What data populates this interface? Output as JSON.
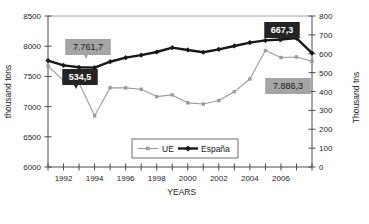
{
  "chart_data": {
    "type": "line",
    "title": "",
    "xlabel": "YEARS",
    "ylabel": "thousand tons",
    "y2label": "Thousand tns",
    "grid": false,
    "legend_position": "bottom-center",
    "x": [
      1991,
      1992,
      1993,
      1994,
      1995,
      1996,
      1997,
      1998,
      1999,
      2000,
      2001,
      2002,
      2003,
      2004,
      2005,
      2006,
      2007,
      2008
    ],
    "xticklabels": [
      "1992",
      "1994",
      "1996",
      "1998",
      "2000",
      "2002",
      "2004",
      "2006"
    ],
    "xtick_years": [
      1992,
      1994,
      1996,
      1998,
      2000,
      2002,
      2004,
      2006
    ],
    "ylim": [
      6000,
      8500
    ],
    "yticks": [
      6000,
      6500,
      7000,
      7500,
      8000,
      8500
    ],
    "yticklabels": [
      "6000",
      "6500",
      "7000",
      "7500",
      "8000",
      "8500"
    ],
    "y2lim": [
      0,
      800
    ],
    "y2ticks": [
      0,
      100,
      200,
      300,
      400,
      500,
      600,
      700,
      800
    ],
    "y2ticklabels": [
      "0",
      "100",
      "200",
      "300",
      "400",
      "500",
      "600",
      "700",
      "800"
    ],
    "series": [
      {
        "name": "UE",
        "axis": "right",
        "color": "#9c9c9c",
        "marker": "square",
        "values": [
          534.5,
          459.0,
          445.0,
          271.0,
          420.0,
          419.0,
          412.0,
          373.0,
          382.0,
          340.0,
          334.0,
          352.0,
          399.0,
          466.0,
          617.0,
          580.0,
          583.0,
          560.0
        ]
      },
      {
        "name": "España",
        "axis": "left",
        "color": "#171717",
        "marker": "diamond",
        "values": [
          7761.7,
          7682.0,
          7651.0,
          7645.0,
          7743.0,
          7810.0,
          7852.0,
          7904.0,
          7976.0,
          7938.0,
          7900.0,
          7948.0,
          8004.0,
          8060.0,
          8096.0,
          8112.0,
          8133.0,
          7886.3
        ]
      }
    ],
    "annotations": [
      {
        "text": "7.761,7",
        "style": "grey-box",
        "series": "España",
        "at_index": 0
      },
      {
        "text": "534,5",
        "style": "dark-box",
        "series": "UE",
        "at_index": 0
      },
      {
        "text": "667,3",
        "style": "dark-box",
        "series": "UE",
        "at_index": 17
      },
      {
        "text": "7.886,3",
        "style": "grey-box",
        "series": "España",
        "at_index": 17
      }
    ]
  },
  "legend": {
    "items": [
      {
        "label": "UE"
      },
      {
        "label": "España"
      }
    ]
  },
  "colors": {
    "ue": "#9c9c9c",
    "espana": "#171717",
    "grey_callout_bg": "#a5a5a5",
    "dark_callout_bg": "#242424",
    "axis": "#4d4d4d"
  }
}
